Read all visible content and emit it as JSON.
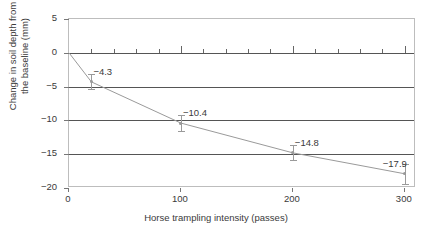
{
  "chart_data": {
    "type": "line",
    "title": "",
    "xlabel": "Horse trampling intensity (passes)",
    "ylabel": "Change in soil depth from the baseline (mm)",
    "ylabel_line1": "Change in soil depth from",
    "ylabel_line2": "the baseline (mm)",
    "xlim": [
      0,
      310
    ],
    "ylim": [
      -20,
      5
    ],
    "grid": true,
    "gridlines_y": [
      0,
      -5,
      -10,
      -15
    ],
    "legend": "none",
    "xticks": [
      0,
      100,
      200,
      300
    ],
    "xtick_labels": [
      "0",
      "100",
      "200",
      "300"
    ],
    "xminor_step": 20,
    "yticks": [
      5,
      0,
      -5,
      -10,
      -15,
      -20
    ],
    "ytick_labels": [
      "5",
      "0",
      "−5",
      "−10",
      "−15",
      "−20"
    ],
    "x": [
      0,
      20,
      100,
      200,
      300
    ],
    "values": [
      0,
      -4.3,
      -10.4,
      -14.8,
      -17.9
    ],
    "errors": [
      0,
      1.1,
      1.2,
      1.1,
      1.5
    ],
    "point_labels": [
      "",
      "−4.3",
      "−10.4",
      "−14.8",
      "−17.9"
    ],
    "series": [
      {
        "name": "Change in soil depth",
        "x": [
          0,
          20,
          100,
          200,
          300
        ],
        "values": [
          0,
          -4.3,
          -10.4,
          -14.8,
          -17.9
        ],
        "errors": [
          0,
          1.1,
          1.2,
          1.1,
          1.5
        ],
        "color": "#9a9a9a"
      }
    ],
    "colors": {
      "line": "#9a9a9a",
      "gridline": "#555555",
      "frame": "#bdbdbd",
      "text": "#3a3a3a",
      "background": "#ffffff"
    }
  }
}
